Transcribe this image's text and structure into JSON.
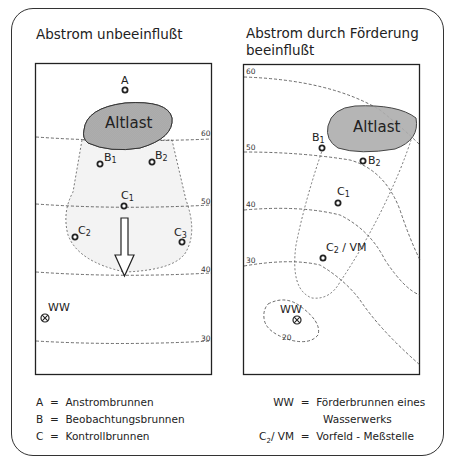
{
  "left_panel": {
    "title": "Abstrom unbeeinflußt",
    "source_label": "Altlast",
    "wells": {
      "A": "A",
      "B1": "B",
      "B1_sub": "1",
      "B2": "B",
      "B2_sub": "2",
      "C1": "C",
      "C1_sub": "1",
      "C2": "C",
      "C2_sub": "2",
      "C3": "C",
      "C3_sub": "3",
      "WW": "WW"
    },
    "contours": [
      "60",
      "50",
      "40",
      "30"
    ]
  },
  "right_panel": {
    "title_line1": "Abstrom durch Förderung",
    "title_line2": "beeinflußt",
    "source_label": "Altlast",
    "wells": {
      "B1": "B",
      "B1_sub": "1",
      "B2": "B",
      "B2_sub": "2",
      "C1": "C",
      "C1_sub": "1",
      "C2VM": "C",
      "C2VM_sub": "2",
      "C2VM_suffix": " / VM",
      "WW": "WW"
    },
    "contours": [
      "60",
      "50",
      "40",
      "30",
      "20"
    ]
  },
  "legend_left": [
    {
      "key": "A",
      "eq": "=",
      "text": "Anstrombrunnen"
    },
    {
      "key": "B",
      "eq": "=",
      "text": "Beobachtungsbrunnen"
    },
    {
      "key": "C",
      "eq": "=",
      "text": "Kontrollbrunnen"
    }
  ],
  "legend_right": [
    {
      "key": "WW",
      "eq": "=",
      "text": "Förderbrunnen eines",
      "text2": "Wasserwerks"
    },
    {
      "key": "C",
      "key_sub": "2",
      "key_suffix": "/ VM",
      "eq": "=",
      "text": "Vorfeld - Meßstelle"
    }
  ],
  "colors": {
    "altlast_fill": "#a9a9a9",
    "plume_fill": "#f2f2f2",
    "line": "#333333"
  }
}
